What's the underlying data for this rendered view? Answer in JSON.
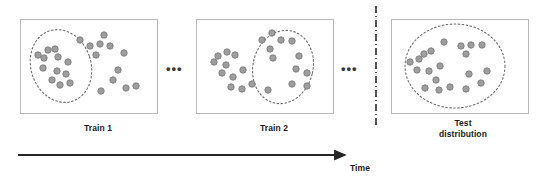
{
  "figure": {
    "title": "",
    "background_color": "#ffffff",
    "panel_border_color": "#b8b8b8",
    "dot_fill_color": "#9e9e9e",
    "dot_stroke_color": "#7d7d7d",
    "ellipse_stroke_color": "#6f6f6f",
    "axis_color": "#262626",
    "separator_color": "#2b2b2b"
  },
  "panels": [
    {
      "id": "train-1",
      "label": "Train 1",
      "frame": {
        "x": 20,
        "y": 19,
        "w": 137,
        "h": 94
      },
      "highlight_ellipse": {
        "cx": 61,
        "cy": 66,
        "rx": 30,
        "ry": 37,
        "rotation": -18
      },
      "points": [
        {
          "x": 38,
          "y": 55
        },
        {
          "x": 48,
          "y": 50
        },
        {
          "x": 55,
          "y": 49
        },
        {
          "x": 44,
          "y": 58
        },
        {
          "x": 58,
          "y": 57
        },
        {
          "x": 43,
          "y": 68
        },
        {
          "x": 57,
          "y": 71
        },
        {
          "x": 68,
          "y": 62
        },
        {
          "x": 66,
          "y": 74
        },
        {
          "x": 52,
          "y": 80
        },
        {
          "x": 60,
          "y": 85
        },
        {
          "x": 70,
          "y": 83
        },
        {
          "x": 80,
          "y": 40
        },
        {
          "x": 90,
          "y": 46
        },
        {
          "x": 100,
          "y": 44
        },
        {
          "x": 110,
          "y": 46
        },
        {
          "x": 104,
          "y": 35
        },
        {
          "x": 96,
          "y": 55
        },
        {
          "x": 124,
          "y": 53
        },
        {
          "x": 118,
          "y": 70
        },
        {
          "x": 113,
          "y": 80
        },
        {
          "x": 126,
          "y": 88
        },
        {
          "x": 136,
          "y": 86
        },
        {
          "x": 101,
          "y": 91
        }
      ]
    },
    {
      "id": "train-2",
      "label": "Train 2",
      "frame": {
        "x": 196,
        "y": 19,
        "w": 137,
        "h": 94
      },
      "highlight_ellipse": {
        "cx": 283,
        "cy": 67,
        "rx": 30,
        "ry": 37,
        "rotation": 14
      },
      "points": [
        {
          "x": 218,
          "y": 56
        },
        {
          "x": 227,
          "y": 52
        },
        {
          "x": 235,
          "y": 55
        },
        {
          "x": 214,
          "y": 62
        },
        {
          "x": 226,
          "y": 65
        },
        {
          "x": 222,
          "y": 73
        },
        {
          "x": 233,
          "y": 77
        },
        {
          "x": 243,
          "y": 70
        },
        {
          "x": 231,
          "y": 87
        },
        {
          "x": 242,
          "y": 89
        },
        {
          "x": 252,
          "y": 84
        },
        {
          "x": 262,
          "y": 40
        },
        {
          "x": 272,
          "y": 33
        },
        {
          "x": 281,
          "y": 40
        },
        {
          "x": 292,
          "y": 41
        },
        {
          "x": 270,
          "y": 49
        },
        {
          "x": 273,
          "y": 58
        },
        {
          "x": 299,
          "y": 56
        },
        {
          "x": 296,
          "y": 69
        },
        {
          "x": 307,
          "y": 73
        },
        {
          "x": 292,
          "y": 84
        },
        {
          "x": 307,
          "y": 86
        },
        {
          "x": 268,
          "y": 90
        }
      ]
    },
    {
      "id": "test-distribution",
      "label": "Test\ndistribution",
      "frame": {
        "x": 391,
        "y": 19,
        "w": 137,
        "h": 94
      },
      "highlight_ellipse": {
        "cx": 455,
        "cy": 66,
        "rx": 50,
        "ry": 42,
        "rotation": 0
      },
      "points": [
        {
          "x": 410,
          "y": 62
        },
        {
          "x": 419,
          "y": 59
        },
        {
          "x": 424,
          "y": 54
        },
        {
          "x": 431,
          "y": 51
        },
        {
          "x": 417,
          "y": 70
        },
        {
          "x": 429,
          "y": 71
        },
        {
          "x": 440,
          "y": 66
        },
        {
          "x": 436,
          "y": 80
        },
        {
          "x": 425,
          "y": 88
        },
        {
          "x": 439,
          "y": 90
        },
        {
          "x": 450,
          "y": 87
        },
        {
          "x": 444,
          "y": 42
        },
        {
          "x": 461,
          "y": 46
        },
        {
          "x": 471,
          "y": 45
        },
        {
          "x": 482,
          "y": 45
        },
        {
          "x": 466,
          "y": 54
        },
        {
          "x": 469,
          "y": 74
        },
        {
          "x": 487,
          "y": 71
        },
        {
          "x": 481,
          "y": 83
        },
        {
          "x": 466,
          "y": 89
        }
      ]
    }
  ],
  "ellipsis_markers": [
    {
      "id": "ellipsis-between-train1-train2",
      "text": "•••"
    },
    {
      "id": "ellipsis-between-train2-test",
      "text": "•••"
    }
  ],
  "separator": {
    "id": "train-test-separator",
    "style": "dash-dot-vertical",
    "x": 376,
    "y_start": 6,
    "y_end": 126
  },
  "time_axis": {
    "label": "Time",
    "x_start": 18,
    "x_end": 349,
    "y": 155,
    "arrow": "right"
  },
  "chart_data": {
    "type": "scatter",
    "title": "",
    "xlabel": "Time",
    "ylabel": "",
    "series": [
      {
        "name": "Train 1",
        "n_points": 24,
        "highlighted_region": "left cluster",
        "x": [
          38,
          48,
          55,
          44,
          58,
          43,
          57,
          68,
          66,
          52,
          60,
          70,
          80,
          90,
          100,
          110,
          104,
          96,
          124,
          118,
          113,
          126,
          136,
          101
        ],
        "y": [
          55,
          50,
          49,
          58,
          57,
          68,
          71,
          62,
          74,
          80,
          85,
          83,
          40,
          46,
          44,
          46,
          35,
          55,
          53,
          70,
          80,
          88,
          86,
          91
        ]
      },
      {
        "name": "Train 2",
        "n_points": 23,
        "highlighted_region": "right cluster",
        "x": [
          218,
          227,
          235,
          214,
          226,
          222,
          233,
          243,
          231,
          242,
          252,
          262,
          272,
          281,
          292,
          270,
          273,
          299,
          296,
          307,
          292,
          307,
          268
        ],
        "y": [
          56,
          52,
          55,
          62,
          65,
          73,
          77,
          70,
          87,
          89,
          84,
          40,
          33,
          40,
          41,
          49,
          58,
          56,
          69,
          73,
          84,
          86,
          90
        ]
      },
      {
        "name": "Test distribution",
        "n_points": 20,
        "highlighted_region": "entire panel",
        "x": [
          410,
          419,
          424,
          431,
          417,
          429,
          440,
          436,
          425,
          439,
          450,
          444,
          461,
          471,
          482,
          466,
          469,
          487,
          481,
          466
        ],
        "y": [
          62,
          59,
          54,
          51,
          70,
          71,
          66,
          80,
          88,
          90,
          87,
          42,
          46,
          45,
          45,
          54,
          74,
          71,
          83,
          89
        ]
      }
    ],
    "legend_position": "none",
    "grid": false
  }
}
